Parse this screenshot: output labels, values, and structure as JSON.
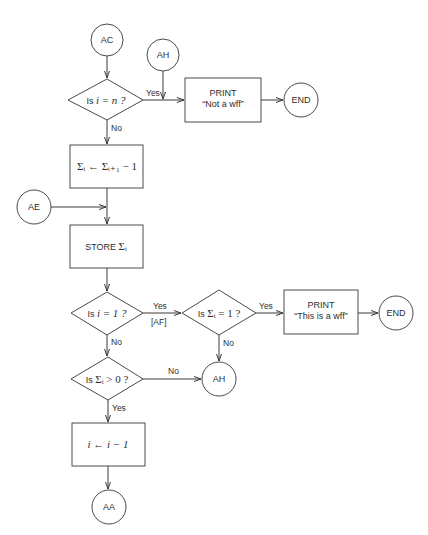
{
  "connectors": {
    "ac": "AC",
    "ah_top": "AH",
    "ae": "AE",
    "ah_bottom": "AH",
    "aa": "AA",
    "end_1": "END",
    "end_2": "END"
  },
  "decisions": {
    "d1": {
      "text_pre": "Is ",
      "text_math": "i = n ?",
      "yes": "Yes",
      "no": "No"
    },
    "d2": {
      "text_pre": "Is ",
      "text_math": "i = 1 ?",
      "yes": "Yes",
      "yes_sub": "[AF]",
      "no": "No"
    },
    "d3": {
      "text_pre": "Is ",
      "text_math": "Σᵢ = 1 ?",
      "yes": "Yes",
      "no": "No"
    },
    "d4": {
      "text_pre": "Is ",
      "text_math": "Σᵢ > 0 ?",
      "yes": "Yes",
      "no": "No"
    }
  },
  "processes": {
    "p_sigma": {
      "text": "Σᵢ ← Σᵢ₊₁ − 1"
    },
    "p_store": {
      "label": "STORE",
      "math": "Σᵢ"
    },
    "p_decrement": {
      "text": "i ← i − 1"
    },
    "print_1": {
      "line1": "PRINT",
      "line2": "“Not a wff”"
    },
    "print_2": {
      "line1": "PRINT",
      "line2": "“This is a wff”"
    }
  }
}
